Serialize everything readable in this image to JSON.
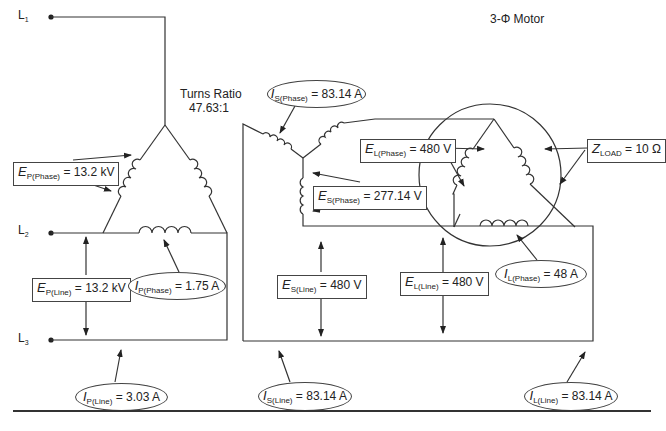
{
  "lines": {
    "l1": {
      "symbol": "L",
      "sub": "1"
    },
    "l2": {
      "symbol": "L",
      "sub": "2"
    },
    "l3": {
      "symbol": "L",
      "sub": "3"
    }
  },
  "transformer": {
    "turns_ratio_title": "Turns Ratio",
    "turns_ratio_value": "47.63:1"
  },
  "motor": {
    "title": "3-Φ Motor"
  },
  "annotations": {
    "ep_phase": {
      "symbol": "E",
      "sub": "P(Phase)",
      "value": "= 13.2 kV"
    },
    "ep_line": {
      "symbol": "E",
      "sub": "P(Line)",
      "value": "= 13.2 kV"
    },
    "ip_phase": {
      "symbol": "I",
      "sub": "P(Phase)",
      "value": "= 1.75 A"
    },
    "ip_line": {
      "symbol": "I",
      "sub": "P(Line)",
      "value": "= 3.03 A"
    },
    "is_phase": {
      "symbol": "I",
      "sub": "S(Phase)",
      "value": "= 83.14 A"
    },
    "es_phase": {
      "symbol": "E",
      "sub": "S(Phase)",
      "value": "= 277.14 V"
    },
    "es_line": {
      "symbol": "E",
      "sub": "S(Line)",
      "value": "= 480 V"
    },
    "is_line": {
      "symbol": "I",
      "sub": "S(Line)",
      "value": "= 83.14 A"
    },
    "el_phase": {
      "symbol": "E",
      "sub": "L(Phase)",
      "value": "= 480 V"
    },
    "el_line": {
      "symbol": "E",
      "sub": "L(Line)",
      "value": "= 480 V"
    },
    "il_phase": {
      "symbol": "I",
      "sub": "L(Phase)",
      "value": "= 48 A"
    },
    "il_line": {
      "symbol": "I",
      "sub": "L(Line)",
      "value": "= 83.14 A"
    },
    "z_load": {
      "symbol": "Z",
      "sub": "LOAD",
      "value": "= 10 Ω"
    }
  }
}
